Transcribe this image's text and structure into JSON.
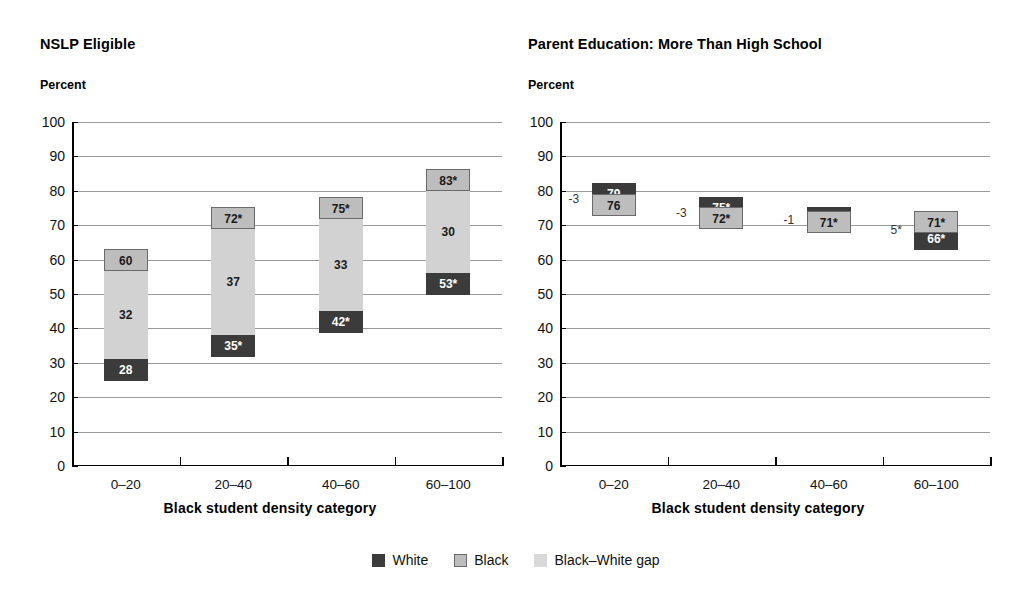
{
  "legend": {
    "items": [
      {
        "label": "White",
        "color": "#3b3b3b",
        "key": "white"
      },
      {
        "label": "Black",
        "color": "#bdbdbd",
        "key": "black"
      },
      {
        "label": "Black–White gap",
        "color": "#d9d9d9",
        "key": "gap"
      }
    ]
  },
  "panels": [
    {
      "id": "nslp",
      "title": "NSLP Eligible",
      "axis_unit": "Percent",
      "xlabel": "Black student density category"
    },
    {
      "id": "parent-education",
      "title": "Parent Education: More Than High School",
      "axis_unit": "Percent",
      "xlabel": "Black student density category"
    }
  ],
  "yticks": [
    "100",
    "90",
    "80",
    "70",
    "60",
    "50",
    "40",
    "30",
    "20",
    "10",
    "0"
  ],
  "categories": [
    "0–20",
    "20–40",
    "40–60",
    "60–100"
  ],
  "chart_data": [
    {
      "type": "bar",
      "title": "NSLP Eligible",
      "subtitle": "Percent",
      "xlabel": "Black student density category",
      "ylabel": "Percent",
      "ylim": [
        0,
        100
      ],
      "ytick_step": 10,
      "grid": true,
      "legend_position": "bottom-center",
      "categories": [
        "0–20",
        "20–40",
        "40–60",
        "60–100"
      ],
      "series": [
        {
          "name": "White",
          "values": [
            28,
            35,
            42,
            53
          ],
          "labels": [
            "28",
            "35*",
            "42*",
            "53*"
          ]
        },
        {
          "name": "Black",
          "values": [
            60,
            72,
            75,
            83
          ],
          "labels": [
            "60",
            "72*",
            "75*",
            "83*"
          ]
        },
        {
          "name": "Black–White gap",
          "values": [
            32,
            37,
            33,
            30
          ],
          "labels": [
            "32",
            "37",
            "33",
            "30"
          ]
        }
      ]
    },
    {
      "type": "bar",
      "title": "Parent Education: More Than High School",
      "subtitle": "Percent",
      "xlabel": "Black student density category",
      "ylabel": "Percent",
      "ylim": [
        0,
        100
      ],
      "ytick_step": 10,
      "grid": true,
      "legend_position": "bottom-center",
      "categories": [
        "0–20",
        "20–40",
        "40–60",
        "60–100"
      ],
      "series": [
        {
          "name": "White",
          "values": [
            79,
            75,
            72,
            66
          ],
          "labels": [
            "79",
            "75*",
            "72*",
            "66*"
          ]
        },
        {
          "name": "Black",
          "values": [
            76,
            72,
            71,
            71
          ],
          "labels": [
            "76",
            "72*",
            "71*",
            "71*"
          ]
        },
        {
          "name": "Black–White gap",
          "values": [
            -3,
            -3,
            -1,
            5
          ],
          "labels": [
            "-3",
            "-3",
            "-1",
            "5*"
          ]
        }
      ]
    }
  ]
}
